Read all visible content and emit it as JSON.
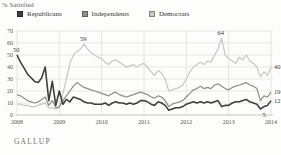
{
  "header": {
    "axis_unit": "% Satisfied"
  },
  "footer": {
    "source": "GALLUP"
  },
  "chart_data": {
    "type": "line",
    "title": "",
    "xlabel": "",
    "ylabel": "% Satisfied",
    "ylim": [
      0,
      70
    ],
    "y_ticks": [
      0,
      10,
      20,
      30,
      40,
      50,
      60,
      70
    ],
    "x_tick_labels": [
      "2008",
      "2009",
      "2010",
      "2011",
      "2012",
      "2013",
      "2014"
    ],
    "x_unit": "monthly, Jan 2008 - Jan 2014",
    "grid": "on",
    "legend_position": "top",
    "series": [
      {
        "name": "Republicans",
        "color": "#404040",
        "values": [
          50,
          44,
          39,
          34,
          31,
          28,
          27,
          31,
          40,
          12,
          28,
          8,
          20,
          9,
          13,
          11,
          15,
          14,
          13,
          11,
          10,
          10,
          9,
          9,
          9,
          10,
          8,
          10,
          11,
          10,
          10,
          9,
          10,
          9,
          10,
          12,
          12,
          11,
          9,
          8,
          11,
          10,
          8,
          4,
          5,
          6,
          6,
          7,
          9,
          10,
          11,
          10,
          11,
          10,
          11,
          10,
          11,
          12,
          7,
          8,
          8,
          10,
          11,
          11,
          12,
          13,
          11,
          10,
          9,
          5,
          7,
          8,
          12
        ]
      },
      {
        "name": "Independents",
        "color": "#8f8f8f",
        "values": [
          17,
          16,
          14,
          12,
          11,
          10,
          11,
          13,
          15,
          8,
          12,
          6,
          7,
          12,
          16,
          20,
          24,
          27,
          25,
          23,
          22,
          21,
          20,
          19,
          18,
          17,
          16,
          18,
          19,
          17,
          16,
          15,
          16,
          17,
          18,
          19,
          18,
          17,
          15,
          14,
          16,
          15,
          12,
          7,
          9,
          10,
          11,
          12,
          15,
          18,
          21,
          22,
          24,
          22,
          23,
          22,
          25,
          26,
          24,
          22,
          21,
          23,
          24,
          25,
          26,
          27,
          25,
          24,
          22,
          12,
          16,
          15,
          19
        ]
      },
      {
        "name": "Democrats",
        "color": "#c8c8c4",
        "values": [
          9,
          9,
          8,
          8,
          7,
          7,
          8,
          9,
          10,
          6,
          6,
          5,
          6,
          18,
          30,
          43,
          50,
          53,
          55,
          59,
          55,
          52,
          50,
          48,
          47,
          44,
          42,
          45,
          46,
          44,
          42,
          40,
          41,
          42,
          40,
          42,
          43,
          40,
          36,
          33,
          37,
          35,
          30,
          20,
          21,
          22,
          23,
          25,
          30,
          36,
          40,
          42,
          44,
          42,
          45,
          44,
          50,
          55,
          64,
          50,
          47,
          45,
          43,
          48,
          46,
          50,
          45,
          43,
          40,
          32,
          36,
          33,
          40
        ]
      }
    ],
    "annotations": [
      {
        "label": "50",
        "series": "Republicans",
        "month_index": 0,
        "value": 50,
        "pos": "above"
      },
      {
        "label": "59",
        "series": "Democrats",
        "month_index": 19,
        "value": 59,
        "pos": "above"
      },
      {
        "label": "64",
        "series": "Democrats",
        "month_index": 58,
        "value": 64,
        "pos": "above"
      },
      {
        "label": "40",
        "series": "Democrats",
        "month_index": 72,
        "value": 40,
        "pos": "right"
      },
      {
        "label": "19",
        "series": "Independents",
        "month_index": 72,
        "value": 19,
        "pos": "right"
      },
      {
        "label": "12",
        "series": "Republicans",
        "month_index": 72,
        "value": 12,
        "pos": "right"
      },
      {
        "label": "5",
        "series": "Republicans",
        "month_index": 69,
        "value": 5,
        "pos": "below"
      }
    ]
  }
}
